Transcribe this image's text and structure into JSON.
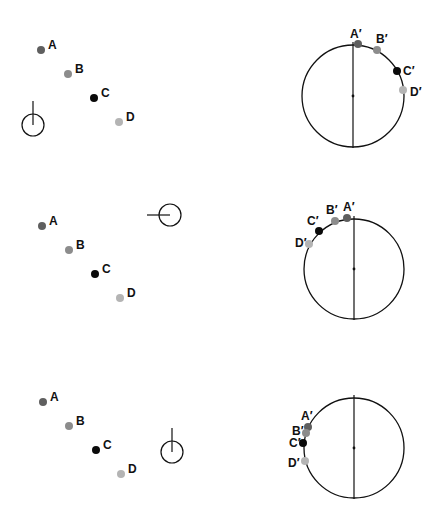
{
  "colors": {
    "A": "#5f5f5f",
    "B": "#8c8c8c",
    "C": "#0a0a0a",
    "D": "#b4b4b4",
    "stroke": "#111111"
  },
  "panels": [
    {
      "points": [
        {
          "label": "A",
          "x": 41,
          "y": 50
        },
        {
          "label": "B",
          "x": 68,
          "y": 74
        },
        {
          "label": "C",
          "x": 94,
          "y": 98
        },
        {
          "label": "D",
          "x": 119,
          "y": 122
        }
      ],
      "viewer": {
        "cx": 33,
        "cy": 125,
        "r": 11,
        "direction": "up"
      },
      "circle": {
        "cx": 353,
        "cy": 96,
        "r": 51
      },
      "projections": [
        {
          "label": "A′",
          "x": 358,
          "y": 44,
          "lx": 350,
          "ly": 38
        },
        {
          "label": "B′",
          "x": 377,
          "y": 50,
          "lx": 376,
          "ly": 43
        },
        {
          "label": "C′",
          "x": 397,
          "y": 71,
          "lx": 403,
          "ly": 75
        },
        {
          "label": "D′",
          "x": 403,
          "y": 90,
          "lx": 410,
          "ly": 96
        }
      ]
    },
    {
      "points": [
        {
          "label": "A",
          "x": 42,
          "y": 226
        },
        {
          "label": "B",
          "x": 69,
          "y": 250
        },
        {
          "label": "C",
          "x": 95,
          "y": 274
        },
        {
          "label": "D",
          "x": 120,
          "y": 298
        }
      ],
      "viewer": {
        "cx": 170,
        "cy": 215,
        "r": 11,
        "direction": "left"
      },
      "circle": {
        "cx": 354,
        "cy": 269,
        "r": 50
      },
      "projections": [
        {
          "label": "A′",
          "x": 347,
          "y": 218,
          "lx": 343,
          "ly": 211
        },
        {
          "label": "B′",
          "x": 335,
          "y": 221,
          "lx": 326,
          "ly": 214
        },
        {
          "label": "C′",
          "x": 319,
          "y": 231,
          "lx": 307,
          "ly": 225
        },
        {
          "label": "D′",
          "x": 309,
          "y": 244,
          "lx": 295,
          "ly": 247
        }
      ]
    },
    {
      "points": [
        {
          "label": "A",
          "x": 43,
          "y": 402
        },
        {
          "label": "B",
          "x": 69,
          "y": 426
        },
        {
          "label": "C",
          "x": 96,
          "y": 450
        },
        {
          "label": "D",
          "x": 121,
          "y": 474
        }
      ],
      "viewer": {
        "cx": 172,
        "cy": 452,
        "r": 11,
        "direction": "up"
      },
      "circle": {
        "cx": 354,
        "cy": 448,
        "r": 50
      },
      "projections": [
        {
          "label": "A′",
          "x": 308,
          "y": 427,
          "lx": 301,
          "ly": 420
        },
        {
          "label": "B′",
          "x": 306,
          "y": 433,
          "lx": 292,
          "ly": 435
        },
        {
          "label": "C′",
          "x": 303,
          "y": 443,
          "lx": 289,
          "ly": 447
        },
        {
          "label": "D′",
          "x": 305,
          "y": 461,
          "lx": 288,
          "ly": 467
        }
      ]
    }
  ]
}
